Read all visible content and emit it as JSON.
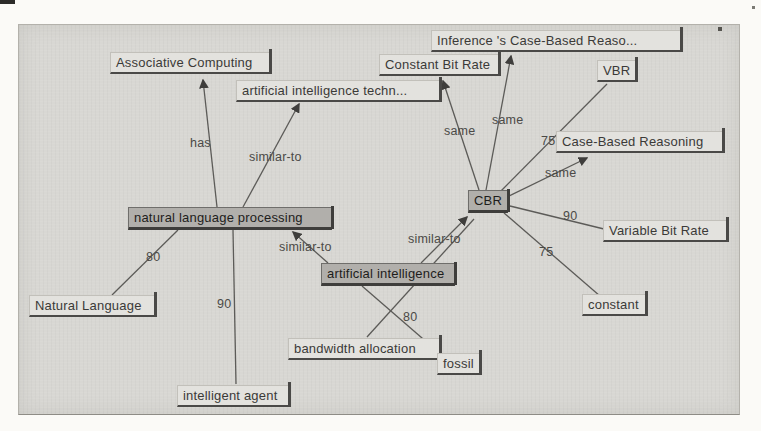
{
  "canvas": {
    "background": "#d8d7d3",
    "page_background": "#fbfaf7",
    "highlight_node_fill": "#b1afab",
    "node_fill": "#e3e2de",
    "edge_color": "#5c5b58"
  },
  "nodes": [
    {
      "id": "associative-computing",
      "label": "Associative Computing",
      "highlighted": false
    },
    {
      "id": "artificial-intelligence-techniques",
      "label": "artificial intelligence techn...",
      "highlighted": false
    },
    {
      "id": "inference-case-based-reasoning",
      "label": "Inference 's Case-Based Reaso...",
      "highlighted": false
    },
    {
      "id": "constant-bit-rate",
      "label": "Constant Bit Rate",
      "highlighted": false
    },
    {
      "id": "vbr",
      "label": "VBR",
      "highlighted": false
    },
    {
      "id": "case-based-reasoning",
      "label": "Case-Based Reasoning",
      "highlighted": false
    },
    {
      "id": "variable-bit-rate",
      "label": "Variable Bit Rate",
      "highlighted": false
    },
    {
      "id": "constant",
      "label": "constant",
      "highlighted": false
    },
    {
      "id": "natural-language",
      "label": "Natural Language",
      "highlighted": false
    },
    {
      "id": "intelligent-agent",
      "label": "intelligent agent",
      "highlighted": false
    },
    {
      "id": "bandwidth-allocation",
      "label": "bandwidth allocation",
      "highlighted": false
    },
    {
      "id": "fossil",
      "label": "fossil",
      "highlighted": false
    },
    {
      "id": "natural-language-processing",
      "label": "natural language processing",
      "highlighted": true
    },
    {
      "id": "artificial-intelligence",
      "label": "artificial intelligence",
      "highlighted": true
    },
    {
      "id": "cbr",
      "label": "CBR",
      "highlighted": true
    }
  ],
  "edges": [
    {
      "from": "natural language processing",
      "to": "Associative Computing",
      "label": "has",
      "arrow": true
    },
    {
      "from": "natural language processing",
      "to": "artificial intelligence techn...",
      "label": "similar-to",
      "arrow": true
    },
    {
      "from": "artificial intelligence",
      "to": "natural language processing",
      "label": "similar-to",
      "arrow": true
    },
    {
      "from": "artificial intelligence",
      "to": "CBR",
      "label": "similar-to",
      "arrow": true
    },
    {
      "from": "CBR",
      "to": "Constant Bit Rate",
      "label": "same",
      "arrow": true
    },
    {
      "from": "CBR",
      "to": "Inference 's Case-Based Reaso...",
      "label": "same",
      "arrow": true
    },
    {
      "from": "CBR",
      "to": "VBR",
      "label": "75",
      "arrow": false
    },
    {
      "from": "CBR",
      "to": "Case-Based Reasoning",
      "label": "same",
      "arrow": true
    },
    {
      "from": "CBR",
      "to": "Variable Bit Rate",
      "label": "90",
      "arrow": false
    },
    {
      "from": "CBR",
      "to": "constant",
      "label": "75",
      "arrow": false
    },
    {
      "from": "natural language processing",
      "to": "Natural Language",
      "label": "80",
      "arrow": false
    },
    {
      "from": "natural language processing",
      "to": "intelligent agent",
      "label": "90",
      "arrow": false
    },
    {
      "from": "bandwidth allocation",
      "to": "CBR",
      "label": "",
      "arrow": false
    },
    {
      "from": "artificial intelligence",
      "to": "fossil",
      "label": "80",
      "arrow": true
    }
  ]
}
